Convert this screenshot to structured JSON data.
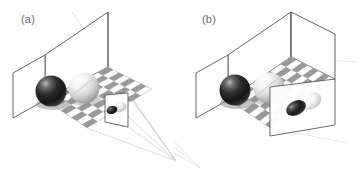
{
  "figure": {
    "background_color": "#ffffff",
    "width": 361,
    "height": 173,
    "type": "scientific-illustration"
  },
  "panels": [
    {
      "id": "a",
      "label": "(a)",
      "description": "Open room with back wall and left wall, checkerboard floor, a dark sphere and a light sphere, a small image plane near the scene, and projection rays converging to a single viewpoint outside the room at the lower right",
      "projection": "perspective",
      "room": {
        "walls": [
          "back-wall",
          "left-wall"
        ],
        "floor": "checkerboard",
        "wall_line_color": "#555555",
        "wall_fill": "#ffffff"
      },
      "floor": {
        "pattern": "checkerboard",
        "light_color": "#ffffff",
        "dark_color": "#9a9a9a",
        "columns": 8,
        "rows": 6
      },
      "objects": [
        {
          "name": "dark-sphere",
          "shade": "dark",
          "base_color": "#1d1d1d",
          "highlight_color": "#b8b8b8",
          "radius_px": 16
        },
        {
          "name": "light-sphere",
          "shade": "light",
          "base_color": "#f2f2f2",
          "highlight_color": "#ffffff",
          "radius_px": 16
        }
      ],
      "image_plane": {
        "name": "image-plane",
        "size": "small",
        "border_color": "#555555",
        "blobs": [
          {
            "name": "dark-projected-blob",
            "shade": "dark"
          },
          {
            "name": "light-projected-blob",
            "shade": "light"
          }
        ]
      },
      "projection_rays": {
        "count": 6,
        "color": "#cccccc",
        "converges": true,
        "vanishing_point": {
          "x": 176,
          "y": 161
        }
      }
    },
    {
      "id": "b",
      "label": "(b)",
      "description": "Closed box with back wall, left wall and right wall, checkerboard floor, a dark sphere and a light sphere, and a large image plane on the right side of the box showing two enlarged ellipsoidal blobs; rays are parallel so no vanishing point is shown",
      "projection": "orthographic",
      "room": {
        "walls": [
          "back-wall",
          "left-wall",
          "right-wall"
        ],
        "floor": "checkerboard",
        "wall_line_color": "#555555",
        "wall_fill": "#ffffff"
      },
      "floor": {
        "pattern": "checkerboard",
        "light_color": "#ffffff",
        "dark_color": "#9a9a9a",
        "columns": 8,
        "rows": 6
      },
      "objects": [
        {
          "name": "dark-sphere",
          "shade": "dark",
          "base_color": "#1d1d1d",
          "highlight_color": "#b8b8b8",
          "radius_px": 16
        },
        {
          "name": "light-sphere",
          "shade": "light",
          "base_color": "#f2f2f2",
          "highlight_color": "#ffffff",
          "radius_px": 16
        }
      ],
      "image_plane": {
        "name": "image-plane",
        "size": "large",
        "border_color": "#555555",
        "blobs": [
          {
            "name": "dark-projected-blob",
            "shade": "dark"
          },
          {
            "name": "light-projected-blob",
            "shade": "light"
          }
        ]
      },
      "projection_rays": {
        "count": 0,
        "color": "#dddddd",
        "converges": false,
        "vanishing_point": null
      }
    }
  ]
}
